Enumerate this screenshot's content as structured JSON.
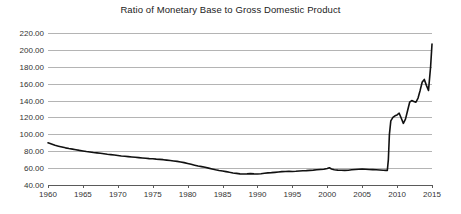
{
  "chart_data": {
    "type": "line",
    "title": "Ratio of Monetary Base to Gross Domestic Product",
    "xlabel": "",
    "ylabel": "",
    "xlim": [
      1959.0,
      1959.0
    ],
    "ylim": [
      40,
      220
    ],
    "grid": true,
    "legend": "none",
    "y_ticks": [
      "220.00",
      "200.00",
      "180.00",
      "160.00",
      "140.00",
      "120.00",
      "100.00",
      "80.00",
      "60.00",
      "40.00"
    ],
    "y_tick_values": [
      220,
      200,
      180,
      160,
      140,
      120,
      100,
      80,
      60,
      40
    ],
    "x_ticks": [
      "1960",
      "1965",
      "1970",
      "1975",
      "1980",
      "1985",
      "1990",
      "1995",
      "2000",
      "2005",
      "2010",
      "2015"
    ],
    "x_tick_values": [
      1960,
      1965,
      1970,
      1975,
      1980,
      1985,
      1990,
      1995,
      2000,
      2005,
      2010,
      2015
    ],
    "line_color": "#111111",
    "grid_color": "#b4b4b4",
    "axis_color": "#5a5a5a",
    "background_color": "#ffffff",
    "series": [
      {
        "name": "Ratio of Monetary Base to GDP",
        "x": [
          1960.0,
          1960.5,
          1961.0,
          1961.5,
          1962.0,
          1962.5,
          1963.0,
          1963.5,
          1964.0,
          1964.5,
          1965.0,
          1965.5,
          1966.0,
          1966.5,
          1967.0,
          1967.5,
          1968.0,
          1968.5,
          1969.0,
          1969.5,
          1970.0,
          1970.5,
          1971.0,
          1971.5,
          1972.0,
          1972.5,
          1973.0,
          1973.5,
          1974.0,
          1974.5,
          1975.0,
          1975.5,
          1976.0,
          1976.5,
          1977.0,
          1977.5,
          1978.0,
          1978.5,
          1979.0,
          1979.5,
          1980.0,
          1980.5,
          1981.0,
          1981.5,
          1982.0,
          1982.5,
          1983.0,
          1983.5,
          1984.0,
          1984.5,
          1985.0,
          1985.5,
          1986.0,
          1986.5,
          1987.0,
          1987.5,
          1988.0,
          1988.5,
          1989.0,
          1989.5,
          1990.0,
          1990.5,
          1991.0,
          1991.5,
          1992.0,
          1992.5,
          1993.0,
          1993.5,
          1994.0,
          1994.5,
          1995.0,
          1995.5,
          1996.0,
          1996.5,
          1997.0,
          1997.5,
          1998.0,
          1998.5,
          1999.0,
          1999.5,
          2000.0,
          2000.3,
          2000.6,
          2001.0,
          2001.5,
          2002.0,
          2002.5,
          2003.0,
          2003.5,
          2004.0,
          2004.5,
          2005.0,
          2005.5,
          2006.0,
          2006.5,
          2007.0,
          2007.5,
          2008.0,
          2008.4,
          2008.6,
          2008.75,
          2008.9,
          2009.1,
          2009.4,
          2009.7,
          2010.0,
          2010.3,
          2010.6,
          2010.9,
          2011.2,
          2011.5,
          2011.8,
          2012.1,
          2012.4,
          2012.7,
          2013.0,
          2013.3,
          2013.6,
          2013.9,
          2014.2,
          2014.5
        ],
        "y": [
          90.0,
          88.5,
          87.0,
          86.0,
          85.0,
          84.0,
          83.2,
          82.5,
          81.8,
          81.0,
          80.3,
          79.6,
          79.0,
          78.4,
          78.0,
          77.5,
          77.0,
          76.4,
          76.0,
          75.6,
          75.0,
          74.4,
          74.0,
          73.6,
          73.2,
          72.8,
          72.4,
          72.0,
          71.6,
          71.2,
          71.0,
          70.6,
          70.4,
          70.0,
          69.5,
          69.0,
          68.5,
          68.0,
          67.3,
          66.5,
          65.5,
          64.5,
          63.5,
          62.5,
          61.8,
          61.0,
          60.0,
          59.0,
          58.0,
          57.2,
          56.5,
          55.8,
          55.0,
          54.3,
          53.8,
          53.2,
          53.0,
          53.2,
          53.5,
          53.2,
          53.0,
          53.4,
          54.0,
          54.3,
          54.6,
          55.0,
          55.4,
          55.8,
          56.0,
          56.2,
          56.0,
          56.2,
          56.5,
          56.8,
          57.0,
          57.3,
          57.6,
          58.0,
          58.3,
          58.6,
          59.5,
          60.5,
          59.0,
          58.0,
          57.6,
          57.4,
          57.3,
          57.5,
          58.0,
          58.4,
          58.6,
          58.8,
          58.6,
          58.4,
          58.2,
          58.0,
          57.8,
          57.5,
          57.3,
          57.2,
          70.0,
          100.0,
          116.0,
          120.0,
          122.0,
          123.0,
          125.0,
          119.0,
          113.0,
          118.0,
          128.0,
          138.0,
          140.0,
          139.0,
          138.0,
          143.0,
          152.0,
          162.0,
          165.0,
          158.0,
          152.0
        ],
        "notes": "Flat near 57 through mid-2008, then a near-vertical surge to about 120 and a stair-step climb to a peak of roughly 207 at the right edge."
      }
    ],
    "series_tail": {
      "x": [
        2014.5,
        2014.8,
        2015.0
      ],
      "y": [
        152.0,
        180.0,
        207.0
      ]
    },
    "annotations": [
      {
        "label": "start value",
        "x": 1960,
        "y": 90.0
      },
      {
        "label": "trough",
        "x": 1988,
        "y": 53.0
      },
      {
        "label": "pre-crisis level",
        "x": 2008.4,
        "y": 57.3
      },
      {
        "label": "peak",
        "x": 2015,
        "y": 207.0
      }
    ]
  }
}
